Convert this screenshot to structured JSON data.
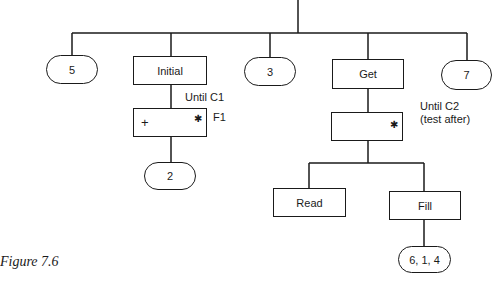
{
  "diagram": {
    "top_level": [
      {
        "id": "n5",
        "type": "terminator",
        "label": "5"
      },
      {
        "id": "initial",
        "type": "process",
        "label": "Initial"
      },
      {
        "id": "n3",
        "type": "terminator",
        "label": "3"
      },
      {
        "id": "get",
        "type": "process",
        "label": "Get"
      },
      {
        "id": "n7",
        "type": "terminator",
        "label": "7"
      }
    ],
    "initial_loop": {
      "condition": "Until C1",
      "plus_mark": "+",
      "iteration_mark": "✱",
      "side_label": "F1",
      "child": {
        "type": "terminator",
        "label": "2"
      }
    },
    "get_loop": {
      "condition_line1": "Until C2",
      "condition_line2": "(test after)",
      "iteration_mark": "✱",
      "children": [
        {
          "id": "read",
          "type": "process",
          "label": "Read"
        },
        {
          "id": "fill",
          "type": "process",
          "label": "Fill"
        }
      ],
      "fill_child": {
        "type": "terminator",
        "label": "6, 1, 4"
      }
    }
  },
  "caption": "Figure 7.6",
  "colors": {
    "line": "#1a1a1a",
    "background": "#ffffff"
  }
}
